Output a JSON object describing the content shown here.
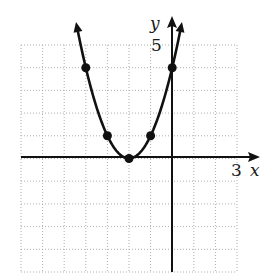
{
  "chart_data": {
    "type": "line",
    "title": "",
    "function": "y = (x + 2)^2",
    "xlabel": "x",
    "ylabel": "y",
    "xlim": [
      -7,
      3
    ],
    "ylim": [
      -5,
      5
    ],
    "grid": true,
    "grid_style": "dotted",
    "tick_labels": {
      "x": [
        "3"
      ],
      "y": [
        "5"
      ]
    },
    "series": [
      {
        "name": "parabola",
        "points": [
          {
            "x": -4,
            "y": 4
          },
          {
            "x": -3,
            "y": 1
          },
          {
            "x": -2,
            "y": 0
          },
          {
            "x": -1,
            "y": 1
          },
          {
            "x": 0,
            "y": 4
          }
        ],
        "arrows_both_ends": true
      }
    ]
  },
  "labels": {
    "x_axis": "x",
    "y_axis": "y",
    "x_tick": "3",
    "y_tick": "5"
  },
  "colors": {
    "curve": "#111111",
    "grid": "#9a9a9a",
    "axes": "#111111"
  }
}
